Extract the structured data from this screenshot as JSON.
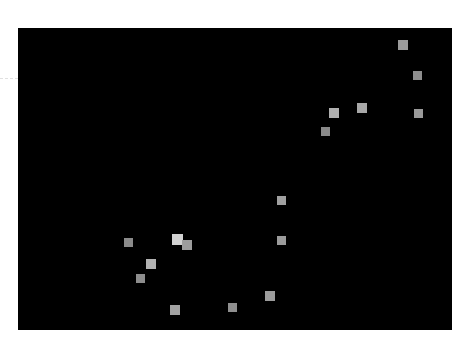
{
  "figure": {
    "width": 456,
    "height": 349,
    "background_color": "#ffffff",
    "title": ""
  },
  "plot": {
    "x": 18,
    "y": 28,
    "width": 434,
    "height": 302,
    "background_color": "#000000",
    "border_color": "#000000"
  },
  "gridline": {
    "name": "horizontal-dashed-gridline",
    "color": "#c8c8c8",
    "x": 0,
    "y": 78,
    "width": 18,
    "style": "dashed"
  },
  "marker": {
    "shape": "square",
    "default_size": 9
  },
  "chart_data": {
    "type": "scatter",
    "title": "",
    "xlabel": "",
    "ylabel": "",
    "xlim": [
      0,
      434
    ],
    "ylim": [
      0,
      302
    ],
    "grid": true,
    "legend": null,
    "series": [
      {
        "name": "points",
        "marker": "square",
        "points": [
          {
            "label": "p1",
            "px": 403,
            "py": 45,
            "size": 10,
            "color": "#9b9b9b"
          },
          {
            "label": "p2",
            "px": 417,
            "py": 75,
            "size": 9,
            "color": "#8e8e8e"
          },
          {
            "label": "p3",
            "px": 418,
            "py": 113,
            "size": 9,
            "color": "#9a9a9a"
          },
          {
            "label": "p4",
            "px": 362,
            "py": 108,
            "size": 10,
            "color": "#a8a8a8"
          },
          {
            "label": "p5",
            "px": 334,
            "py": 113,
            "size": 10,
            "color": "#b0b0b0"
          },
          {
            "label": "p6",
            "px": 325,
            "py": 131,
            "size": 9,
            "color": "#8a8a8a"
          },
          {
            "label": "p7",
            "px": 281,
            "py": 200,
            "size": 9,
            "color": "#a0a0a0"
          },
          {
            "label": "p8",
            "px": 281,
            "py": 240,
            "size": 9,
            "color": "#9b9b9b"
          },
          {
            "label": "p9",
            "px": 270,
            "py": 296,
            "size": 10,
            "color": "#9c9c9c"
          },
          {
            "label": "p10",
            "px": 232,
            "py": 307,
            "size": 9,
            "color": "#8f8f8f"
          },
          {
            "label": "p11",
            "px": 177,
            "py": 239,
            "size": 11,
            "color": "#d2d2d2"
          },
          {
            "label": "p12",
            "px": 187,
            "py": 245,
            "size": 10,
            "color": "#9d9d9d"
          },
          {
            "label": "p13",
            "px": 175,
            "py": 310,
            "size": 10,
            "color": "#a2a2a2"
          },
          {
            "label": "p14",
            "px": 151,
            "py": 264,
            "size": 10,
            "color": "#b2b2b2"
          },
          {
            "label": "p15",
            "px": 140,
            "py": 278,
            "size": 9,
            "color": "#8d8d8d"
          },
          {
            "label": "p16",
            "px": 128,
            "py": 242,
            "size": 9,
            "color": "#8b8b8b"
          }
        ]
      }
    ]
  }
}
